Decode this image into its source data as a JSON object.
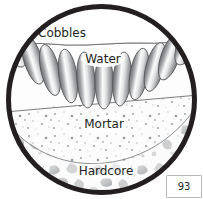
{
  "figure": {
    "name": "cobble-paving-cross-section",
    "shape": "circle",
    "border_color": "#231f20",
    "background_color": "#ffffff"
  },
  "labels": {
    "cobbles": "Cobbles",
    "water": "Water",
    "mortar": "Mortar",
    "hardcore": "Hardcore"
  },
  "layers": [
    {
      "id": "cobbles",
      "label": "Cobbles",
      "label_x": 62,
      "label_y": 33,
      "fill": "#e8e8e8",
      "stroke": "#58595b",
      "count": 11
    },
    {
      "id": "water",
      "label": "Water",
      "label_x": 103,
      "label_y": 59,
      "fill": "#f2f2f2",
      "stroke": "#6d6e71"
    },
    {
      "id": "mortar",
      "label": "Mortar",
      "label_x": 104,
      "label_y": 124,
      "fill": "#fafafa",
      "stroke": "#6d6e71",
      "speckle_color": "#a7a9ac"
    },
    {
      "id": "hardcore",
      "label": "Hardcore",
      "label_x": 106,
      "label_y": 171,
      "fill": "#f4f4f4",
      "stroke": "#bcbec0",
      "aggregate_color": "#c7c8ca"
    }
  ],
  "page_badge": {
    "number": "93"
  },
  "colors": {
    "outline": "#231f20",
    "cobble_dark": "#808285",
    "cobble_light": "#ffffff",
    "mortar_speckle": "#939598",
    "hardcore_stone": "#c9cacc",
    "badge_border": "#b9b9b9"
  }
}
